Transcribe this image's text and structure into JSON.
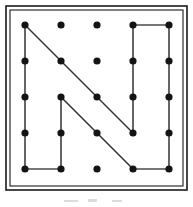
{
  "figure": {
    "board_type": "geoboard",
    "grid": {
      "rows": 5,
      "columns": 5,
      "peg_count": 25,
      "column_x": [
        25,
        61,
        97,
        133,
        169
      ],
      "row_y": [
        25,
        61,
        97,
        133,
        169
      ],
      "peg_radius": 3.6,
      "peg_color": "#141414"
    },
    "frame": {
      "outer": {
        "x": 6,
        "y": 6,
        "width": 181,
        "height": 184
      },
      "inner": {
        "x": 10,
        "y": 10,
        "width": 173,
        "height": 176
      },
      "stroke_color": "#1a1a1a",
      "fill_color": "#ffffff"
    },
    "band_color": "#4a4a4a",
    "diagonal_color": "#303030",
    "pegs": [
      {
        "id": "peg-r0c0",
        "row": 0,
        "col": 0,
        "cx": 25,
        "cy": 25
      },
      {
        "id": "peg-r0c1",
        "row": 0,
        "col": 1,
        "cx": 61,
        "cy": 25
      },
      {
        "id": "peg-r0c2",
        "row": 0,
        "col": 2,
        "cx": 97,
        "cy": 25
      },
      {
        "id": "peg-r0c3",
        "row": 0,
        "col": 3,
        "cx": 133,
        "cy": 25
      },
      {
        "id": "peg-r0c4",
        "row": 0,
        "col": 4,
        "cx": 169,
        "cy": 25
      },
      {
        "id": "peg-r1c0",
        "row": 1,
        "col": 0,
        "cx": 25,
        "cy": 61
      },
      {
        "id": "peg-r1c1",
        "row": 1,
        "col": 1,
        "cx": 61,
        "cy": 61
      },
      {
        "id": "peg-r1c2",
        "row": 1,
        "col": 2,
        "cx": 97,
        "cy": 61
      },
      {
        "id": "peg-r1c3",
        "row": 1,
        "col": 3,
        "cx": 133,
        "cy": 61
      },
      {
        "id": "peg-r1c4",
        "row": 1,
        "col": 4,
        "cx": 169,
        "cy": 61
      },
      {
        "id": "peg-r2c0",
        "row": 2,
        "col": 0,
        "cx": 25,
        "cy": 97
      },
      {
        "id": "peg-r2c1",
        "row": 2,
        "col": 1,
        "cx": 61,
        "cy": 97
      },
      {
        "id": "peg-r2c2",
        "row": 2,
        "col": 2,
        "cx": 97,
        "cy": 97
      },
      {
        "id": "peg-r2c3",
        "row": 2,
        "col": 3,
        "cx": 133,
        "cy": 97
      },
      {
        "id": "peg-r2c4",
        "row": 2,
        "col": 4,
        "cx": 169,
        "cy": 97
      },
      {
        "id": "peg-r3c0",
        "row": 3,
        "col": 0,
        "cx": 25,
        "cy": 133
      },
      {
        "id": "peg-r3c1",
        "row": 3,
        "col": 1,
        "cx": 61,
        "cy": 133
      },
      {
        "id": "peg-r3c2",
        "row": 3,
        "col": 2,
        "cx": 97,
        "cy": 133
      },
      {
        "id": "peg-r3c3",
        "row": 3,
        "col": 3,
        "cx": 133,
        "cy": 133
      },
      {
        "id": "peg-r3c4",
        "row": 3,
        "col": 4,
        "cx": 169,
        "cy": 133
      },
      {
        "id": "peg-r4c0",
        "row": 4,
        "col": 0,
        "cx": 25,
        "cy": 169
      },
      {
        "id": "peg-r4c1",
        "row": 4,
        "col": 1,
        "cx": 61,
        "cy": 169
      },
      {
        "id": "peg-r4c2",
        "row": 4,
        "col": 2,
        "cx": 97,
        "cy": 169
      },
      {
        "id": "peg-r4c3",
        "row": 4,
        "col": 3,
        "cx": 133,
        "cy": 169
      },
      {
        "id": "peg-r4c4",
        "row": 4,
        "col": 4,
        "cx": 169,
        "cy": 169
      }
    ],
    "segments": [
      {
        "id": "segment-left-stem",
        "kind": "vertical",
        "from": "peg-r0c0",
        "to": "peg-r4c0",
        "x1": 25,
        "y1": 25,
        "x2": 25,
        "y2": 169
      },
      {
        "id": "segment-outer-diagonal",
        "kind": "diagonal",
        "from": "peg-r0c0",
        "to": "peg-r3c3",
        "x1": 25,
        "y1": 25,
        "x2": 133,
        "y2": 133
      },
      {
        "id": "segment-right-upper-stem",
        "kind": "vertical",
        "from": "peg-r0c3",
        "to": "peg-r3c3",
        "x1": 133,
        "y1": 25,
        "x2": 133,
        "y2": 133
      },
      {
        "id": "segment-top-bar",
        "kind": "horizontal",
        "from": "peg-r0c3",
        "to": "peg-r0c4",
        "x1": 133,
        "y1": 25,
        "x2": 169,
        "y2": 25
      },
      {
        "id": "segment-right-outer-stem",
        "kind": "vertical",
        "from": "peg-r0c4",
        "to": "peg-r4c4",
        "x1": 169,
        "y1": 25,
        "x2": 169,
        "y2": 169
      },
      {
        "id": "segment-bottom-right-bar",
        "kind": "horizontal",
        "from": "peg-r4c3",
        "to": "peg-r4c4",
        "x1": 133,
        "y1": 169,
        "x2": 169,
        "y2": 169
      },
      {
        "id": "segment-inner-stem",
        "kind": "vertical",
        "from": "peg-r2c1",
        "to": "peg-r4c1",
        "x1": 61,
        "y1": 97,
        "x2": 61,
        "y2": 169
      },
      {
        "id": "segment-inner-diagonal",
        "kind": "diagonal",
        "from": "peg-r2c1",
        "to": "peg-r4c3",
        "x1": 61,
        "y1": 97,
        "x2": 133,
        "y2": 169
      },
      {
        "id": "segment-bottom-left-bar",
        "kind": "horizontal",
        "from": "peg-r4c0",
        "to": "peg-r4c1",
        "x1": 25,
        "y1": 169,
        "x2": 61,
        "y2": 169
      }
    ],
    "caption_smudges": [
      {
        "id": "smudge-left",
        "x": 64,
        "y": 200,
        "width": 14,
        "height": 2
      },
      {
        "id": "smudge-center",
        "x": 88,
        "y": 199,
        "width": 9,
        "height": 3
      },
      {
        "id": "smudge-right",
        "x": 112,
        "y": 200,
        "width": 10,
        "height": 2
      }
    ]
  }
}
